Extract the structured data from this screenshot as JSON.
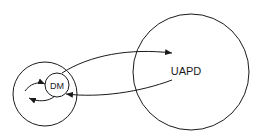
{
  "diagram": {
    "nodes": [
      {
        "id": "outer",
        "label": "",
        "cx": 45,
        "cy": 94,
        "r": 32
      },
      {
        "id": "dm",
        "label": "DM",
        "cx": 57,
        "cy": 85,
        "r": 12
      },
      {
        "id": "uapd",
        "label": "UAPD",
        "cx": 191,
        "cy": 72,
        "r": 58
      }
    ],
    "edges": [
      {
        "from": "dm",
        "to": "uapd",
        "direction": "outgoing"
      },
      {
        "from": "uapd",
        "to": "dm",
        "direction": "incoming"
      },
      {
        "from": "outer",
        "to": "dm",
        "direction": "inner-loop-in"
      },
      {
        "from": "dm",
        "to": "outer",
        "direction": "inner-loop-out"
      }
    ],
    "colors": {
      "stroke": "#1a1a1a",
      "background": "#ffffff"
    }
  }
}
